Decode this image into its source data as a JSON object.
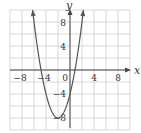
{
  "chart_data": {
    "type": "line",
    "title": "",
    "xlabel": "x",
    "ylabel": "y",
    "xlim": [
      -10,
      10
    ],
    "ylim": [
      -10,
      10
    ],
    "grid": true,
    "grid_step": 2,
    "x_ticks": [
      -8,
      -4,
      0,
      4,
      8
    ],
    "y_ticks": [
      8,
      4,
      -4,
      -8
    ],
    "x_tick_labels": [
      "−8",
      "−4",
      "0",
      "4",
      "8"
    ],
    "y_tick_labels": [
      "8",
      "4",
      "−4",
      "−8"
    ],
    "series": [
      {
        "name": "parabola",
        "equation": "y = (x + 2)^2 - 8",
        "vertex": [
          -2,
          -8
        ],
        "y_intercept": -4,
        "x_intercepts": [
          -4.83,
          0.83
        ],
        "x": [
          -6.24,
          -6,
          -5,
          -4,
          -3,
          -2,
          -1,
          0,
          1,
          2,
          2.24
        ],
        "values": [
          10,
          8,
          1,
          -4,
          -7,
          -8,
          -7,
          -4,
          1,
          8,
          10
        ],
        "arrows_at_ends": true
      }
    ],
    "colors": {
      "curve": "#555555",
      "grid": "#cfcfcf",
      "axes": "#444444"
    }
  }
}
